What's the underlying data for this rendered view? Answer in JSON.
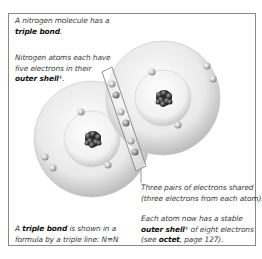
{
  "captions": {
    "intro": {
      "pre": "A nitrogen molecule has a",
      "bold": "triple bond",
      "post": "."
    },
    "outer_shell": {
      "line1": "Nitrogen atoms each have",
      "line2": "five electrons in their",
      "bold": "outer shell",
      "post": "*."
    },
    "shared": {
      "line1": "Three pairs of electrons shared",
      "line2": "(three electrons from each atom)."
    },
    "stable": {
      "line1": "Each atom now has a stable",
      "bold1": "outer shell",
      "mid": "* of eight electrons",
      "pre3": "(see ",
      "bold2": "octet",
      "post3": ", page 127)."
    },
    "formula": {
      "pre": "A ",
      "bold": "triple bond",
      "post": " is shown in a",
      "line2": "formula by a triple line: N≡N"
    }
  },
  "diagram": {
    "atoms": [
      {
        "name": "left-nitrogen-atom",
        "cx": 92,
        "cy": 139,
        "outer_r": 58,
        "inner_r": 28
      },
      {
        "name": "right-nitrogen-atom",
        "cx": 163,
        "cy": 98,
        "outer_r": 57,
        "inner_r": 28
      }
    ],
    "shared_electron_pairs": 3,
    "colors": {
      "frame": "#8a8a8a",
      "shell": "#d8d8d8",
      "nucleus": "#333333",
      "electron": "#bdbdbd"
    }
  }
}
